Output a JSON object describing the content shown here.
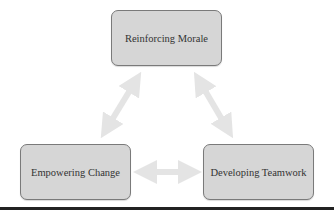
{
  "diagram": {
    "nodes": [
      {
        "id": "top",
        "label": "Reinforcing Morale"
      },
      {
        "id": "left",
        "label": "Empowering Change"
      },
      {
        "id": "right",
        "label": "Developing Teamwork"
      }
    ],
    "edges": [
      {
        "from": "top",
        "to": "left",
        "type": "bidirectional"
      },
      {
        "from": "top",
        "to": "right",
        "type": "bidirectional"
      },
      {
        "from": "left",
        "to": "right",
        "type": "bidirectional"
      }
    ],
    "colors": {
      "box_fill": "#d6d6d6",
      "box_border": "#7a7a7a",
      "arrow": "#e6e6e6",
      "rule": "#222222"
    }
  }
}
